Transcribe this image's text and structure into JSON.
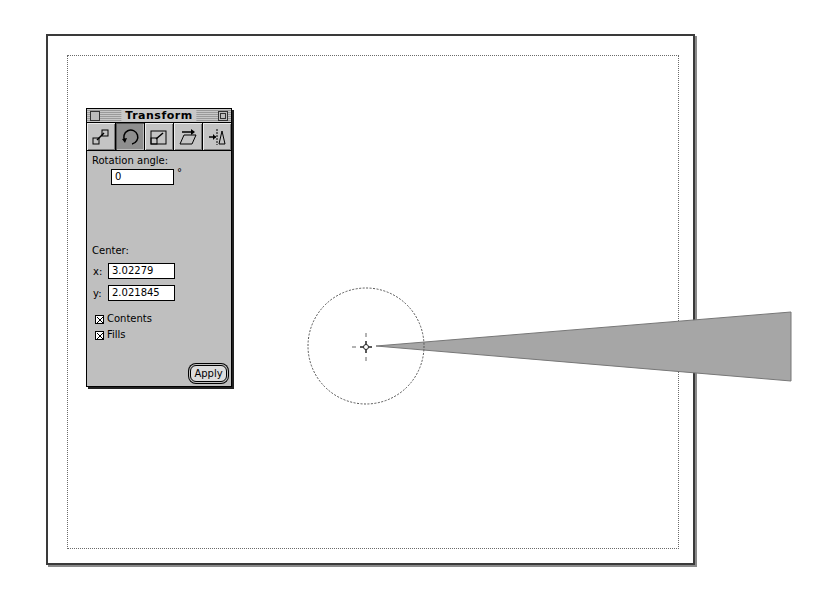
{
  "palette": {
    "title": "Transform",
    "tools": [
      {
        "name": "move",
        "icon": "move-icon",
        "selected": false
      },
      {
        "name": "rotate",
        "icon": "rotate-icon",
        "selected": true
      },
      {
        "name": "scale",
        "icon": "scale-icon",
        "selected": false
      },
      {
        "name": "skew",
        "icon": "skew-icon",
        "selected": false
      },
      {
        "name": "reflect",
        "icon": "reflect-icon",
        "selected": false
      }
    ],
    "rotation_label": "Rotation angle:",
    "rotation_value": "0",
    "degree_symbol": "°",
    "center_label": "Center:",
    "x_label": "x:",
    "x_value": "3.02279",
    "y_label": "y:",
    "y_value": "2.021845",
    "contents_label": "Contents",
    "contents_checked": true,
    "fills_label": "Fills",
    "fills_checked": true,
    "apply_label": "Apply"
  },
  "canvas": {
    "circle": {
      "cx": 366,
      "cy": 346,
      "r": 58
    },
    "center_marker": {
      "x": 366,
      "y": 347
    },
    "wedge": {
      "points": "376,346 791,312 791,381",
      "fill": "#a6a6a6"
    },
    "page_border_color": "#3a3a3a"
  }
}
